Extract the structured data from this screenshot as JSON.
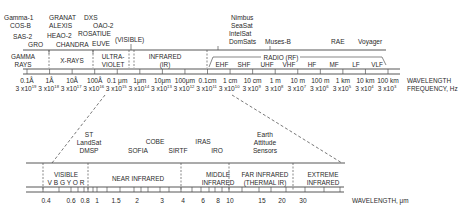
{
  "diagram": {
    "colors": {
      "ink": "#2a2a2a",
      "line": "#444444",
      "background": "#ffffff"
    },
    "top_spectrum": {
      "missions": [
        {
          "label": "Gamma-1",
          "x": 4,
          "y": 20
        },
        {
          "label": "COS-B",
          "x": 10,
          "y": 28
        },
        {
          "label": "SAS-2",
          "x": 13,
          "y": 39
        },
        {
          "label": "GRO",
          "x": 28,
          "y": 47
        },
        {
          "label": "GRANAT",
          "x": 49,
          "y": 20
        },
        {
          "label": "ALEXIS",
          "x": 49,
          "y": 28
        },
        {
          "label": "HEAO-2",
          "x": 47,
          "y": 38
        },
        {
          "label": "CHANDRA",
          "x": 56,
          "y": 47
        },
        {
          "label": "DXS",
          "x": 84,
          "y": 20
        },
        {
          "label": "OAO-2",
          "x": 93,
          "y": 28
        },
        {
          "label": "ROSAT",
          "x": 78,
          "y": 36
        },
        {
          "label": "IUE",
          "x": 100,
          "y": 36
        },
        {
          "label": "EUVE",
          "x": 92,
          "y": 46
        },
        {
          "label": "(VISIBLE)",
          "x": 115,
          "y": 42
        },
        {
          "label": "Nimbus",
          "x": 231,
          "y": 20
        },
        {
          "label": "SeaSat",
          "x": 231,
          "y": 28
        },
        {
          "label": "IntelSat",
          "x": 229,
          "y": 36
        },
        {
          "label": "DomSats",
          "x": 229,
          "y": 44
        },
        {
          "label": "Muses-B",
          "x": 265,
          "y": 44
        },
        {
          "label": "RAE",
          "x": 331,
          "y": 44
        },
        {
          "label": "Voyager",
          "x": 358,
          "y": 44
        }
      ],
      "bands": [
        {
          "label": "GAMMA",
          "label2": "RAYS",
          "x": 23
        },
        {
          "label": "X-RAYS",
          "label2": "",
          "x": 72
        },
        {
          "label": "ULTRA-",
          "label2": "VIOLET",
          "x": 113
        },
        {
          "label": "INFRARED",
          "label2": "(IR)",
          "x": 165
        }
      ],
      "radio": {
        "label": "RADIO (RF)",
        "sub_bands": [
          "EHF",
          "SHF",
          "UHF",
          "VHF",
          "HF",
          "MF",
          "LF",
          "VLF"
        ]
      },
      "wavelengths": [
        "0.1Å",
        "1Å",
        "10Å",
        "100Å",
        "0.1 μm",
        "1μm",
        "10μm",
        "100μm",
        "0.1cm",
        "1 cm",
        "10 cm",
        "1 m",
        "10 m",
        "100 m",
        "1 km",
        "10 km",
        "100 km"
      ],
      "frequencies_exp": [
        "19",
        "18",
        "17",
        "16",
        "15",
        "14",
        "13",
        "12",
        "11",
        "10",
        "9",
        "8",
        "7",
        "6",
        "5",
        "4",
        "3"
      ],
      "frequency_base": "3 x10",
      "wavelength_label": "WAVELENGTH",
      "frequency_label": "FREQUENCY, Hz"
    },
    "bottom_spectrum": {
      "missions": [
        {
          "label": "ST",
          "x": 89,
          "y": 137
        },
        {
          "label": "LandSat",
          "x": 89,
          "y": 145
        },
        {
          "label": "DMSP",
          "x": 89,
          "y": 153
        },
        {
          "label": "SOFIA",
          "x": 138,
          "y": 153
        },
        {
          "label": "COBE",
          "x": 155,
          "y": 144
        },
        {
          "label": "SIRTF",
          "x": 178,
          "y": 153
        },
        {
          "label": "IRAS",
          "x": 203,
          "y": 144
        },
        {
          "label": "IRO",
          "x": 217,
          "y": 153
        },
        {
          "label": "Earth",
          "x": 265,
          "y": 137
        },
        {
          "label": "Attitude",
          "x": 265,
          "y": 145
        },
        {
          "label": "Sensors",
          "x": 265,
          "y": 153
        }
      ],
      "bands": [
        {
          "label": "VISIBLE",
          "label2": "V B G Y O R",
          "x": 66
        },
        {
          "label": "NEAR INFRARED",
          "label2": "",
          "x": 138
        },
        {
          "label": "MIDDLE",
          "label2": "INFRARED",
          "x": 218
        },
        {
          "label": "FAR INFRARED",
          "label2": "(THERMAL IR)",
          "x": 265
        },
        {
          "label": "EXTREME",
          "label2": "INFRARED",
          "x": 323
        }
      ],
      "ticks": [
        "0.4",
        "0.6",
        "0.8",
        "1",
        "1.5",
        "2",
        "3",
        "4",
        "6",
        "8",
        "10",
        "15",
        "20",
        "30"
      ],
      "wavelength_label": "WAVELENGTH, μm"
    }
  }
}
